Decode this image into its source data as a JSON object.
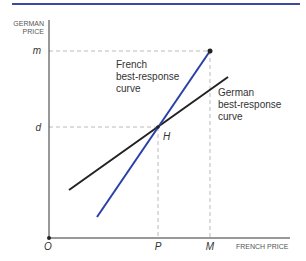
{
  "header": {
    "rule_color": "#3a4aa0"
  },
  "diagram": {
    "y_axis_label_line1": "GERMAN",
    "y_axis_label_line2": "PRICE",
    "x_axis_label": "FRENCH PRICE",
    "origin_label": "O",
    "x_ticks": [
      {
        "label": "P"
      },
      {
        "label": "M"
      }
    ],
    "y_ticks": [
      {
        "label": "m"
      },
      {
        "label": "d"
      }
    ],
    "equilibrium_label": "H",
    "french_curve": {
      "label_line1": "French",
      "label_line2": "best-response",
      "label_line3": "curve",
      "color": "#2a3fa8"
    },
    "german_curve": {
      "label_line1": "German",
      "label_line2": "best-response",
      "label_line3": "curve",
      "color": "#222222"
    }
  }
}
